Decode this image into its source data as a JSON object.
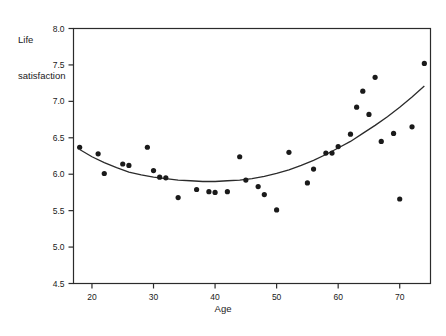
{
  "chart_data": {
    "type": "scatter",
    "title": "",
    "xlabel": "Age",
    "ylabel": "Life\nsatisfaction",
    "ylabel_line1": "Life",
    "ylabel_line2": "satisfaction",
    "xlim": [
      17,
      75
    ],
    "ylim": [
      4.5,
      8.0
    ],
    "xticks": [
      20,
      30,
      40,
      50,
      60,
      70
    ],
    "xtick_labels": [
      "20",
      "30",
      "40",
      "50",
      "60",
      "70"
    ],
    "yticks": [
      4.5,
      5.0,
      5.5,
      6.0,
      6.5,
      7.0,
      7.5,
      8.0
    ],
    "ytick_labels": [
      "4.5",
      "5.0",
      "5.5",
      "6.0",
      "6.5",
      "7.0",
      "7.5",
      "8.0"
    ],
    "grid": false,
    "legend": null,
    "frame": true,
    "marker_color": "#1a1a1a",
    "line_color": "#2b2b2b",
    "points": [
      {
        "x": 18,
        "y": 6.37
      },
      {
        "x": 21,
        "y": 6.28
      },
      {
        "x": 22,
        "y": 6.01
      },
      {
        "x": 25,
        "y": 6.14
      },
      {
        "x": 26,
        "y": 6.12
      },
      {
        "x": 29,
        "y": 6.37
      },
      {
        "x": 30,
        "y": 6.05
      },
      {
        "x": 31,
        "y": 5.96
      },
      {
        "x": 32,
        "y": 5.95
      },
      {
        "x": 34,
        "y": 5.68
      },
      {
        "x": 37,
        "y": 5.79
      },
      {
        "x": 39,
        "y": 5.76
      },
      {
        "x": 40,
        "y": 5.75
      },
      {
        "x": 42,
        "y": 5.76
      },
      {
        "x": 44,
        "y": 6.24
      },
      {
        "x": 45,
        "y": 5.92
      },
      {
        "x": 47,
        "y": 5.83
      },
      {
        "x": 48,
        "y": 5.72
      },
      {
        "x": 50,
        "y": 5.51
      },
      {
        "x": 52,
        "y": 6.3
      },
      {
        "x": 55,
        "y": 5.88
      },
      {
        "x": 56,
        "y": 6.07
      },
      {
        "x": 58,
        "y": 6.29
      },
      {
        "x": 59,
        "y": 6.29
      },
      {
        "x": 60,
        "y": 6.38
      },
      {
        "x": 62,
        "y": 6.55
      },
      {
        "x": 63,
        "y": 6.92
      },
      {
        "x": 64,
        "y": 7.14
      },
      {
        "x": 65,
        "y": 6.82
      },
      {
        "x": 66,
        "y": 7.33
      },
      {
        "x": 67,
        "y": 6.45
      },
      {
        "x": 69,
        "y": 6.56
      },
      {
        "x": 70,
        "y": 5.66
      },
      {
        "x": 72,
        "y": 6.65
      },
      {
        "x": 74,
        "y": 7.52
      }
    ],
    "fit_curve": {
      "name": "quadratic-fit",
      "points": [
        {
          "x": 18,
          "y": 6.34
        },
        {
          "x": 20,
          "y": 6.24
        },
        {
          "x": 22,
          "y": 6.16
        },
        {
          "x": 24,
          "y": 6.09
        },
        {
          "x": 26,
          "y": 6.03
        },
        {
          "x": 28,
          "y": 5.99
        },
        {
          "x": 30,
          "y": 5.96
        },
        {
          "x": 32,
          "y": 5.94
        },
        {
          "x": 34,
          "y": 5.92
        },
        {
          "x": 36,
          "y": 5.91
        },
        {
          "x": 38,
          "y": 5.9
        },
        {
          "x": 40,
          "y": 5.9
        },
        {
          "x": 42,
          "y": 5.91
        },
        {
          "x": 44,
          "y": 5.92
        },
        {
          "x": 46,
          "y": 5.94
        },
        {
          "x": 48,
          "y": 5.97
        },
        {
          "x": 50,
          "y": 6.01
        },
        {
          "x": 52,
          "y": 6.06
        },
        {
          "x": 54,
          "y": 6.12
        },
        {
          "x": 56,
          "y": 6.19
        },
        {
          "x": 58,
          "y": 6.27
        },
        {
          "x": 60,
          "y": 6.36
        },
        {
          "x": 62,
          "y": 6.45
        },
        {
          "x": 64,
          "y": 6.56
        },
        {
          "x": 66,
          "y": 6.67
        },
        {
          "x": 68,
          "y": 6.79
        },
        {
          "x": 70,
          "y": 6.92
        },
        {
          "x": 72,
          "y": 7.06
        },
        {
          "x": 74,
          "y": 7.21
        }
      ]
    }
  }
}
